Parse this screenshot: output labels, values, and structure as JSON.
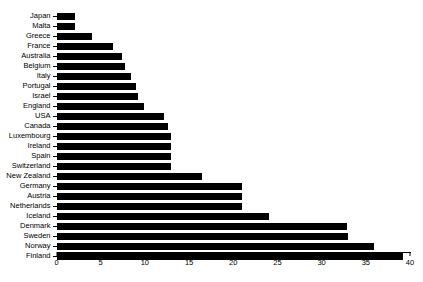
{
  "chart_data": {
    "type": "bar",
    "orientation": "horizontal",
    "title": "",
    "subtitle": "",
    "xlabel": "",
    "ylabel": "",
    "xlim": [
      0,
      40
    ],
    "ylim": null,
    "grid": false,
    "legend": null,
    "bar_color": "#000000",
    "background_color": "#ffffff",
    "axis_color": "#000000",
    "xticks": [
      0,
      5,
      10,
      15,
      20,
      25,
      30,
      35,
      40
    ],
    "xtick_labels": [
      "0",
      "5",
      "10",
      "15",
      "20",
      "25",
      "30",
      "35",
      "40"
    ],
    "categories": [
      "Japan",
      "Malta",
      "Greece",
      "France",
      "Australia",
      "Belgium",
      "Italy",
      "Portugal",
      "Israel",
      "England",
      "USA",
      "Canada",
      "Luxembourg",
      "Ireland",
      "Spain",
      "Switzerland",
      "New Zealand",
      "Germany",
      "Austria",
      "Netherlands",
      "Iceland",
      "Denmark",
      "Sweden",
      "Norway",
      "Finland"
    ],
    "values": [
      2.1,
      2.1,
      4.0,
      6.4,
      7.4,
      7.8,
      8.4,
      9.0,
      9.2,
      9.9,
      12.2,
      12.6,
      13.0,
      13.0,
      13.0,
      13.0,
      16.5,
      21.0,
      21.0,
      21.0,
      24.0,
      32.9,
      33.0,
      35.9,
      39.2
    ]
  }
}
